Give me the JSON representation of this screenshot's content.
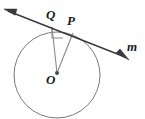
{
  "figure": {
    "kind": "geometry-diagram",
    "background_color": "#ffffff",
    "stroke_color": "#6b6b6b",
    "line_color": "#3a3a3a",
    "label_color": "#1a1a1a",
    "width": 145,
    "height": 119
  },
  "circle": {
    "label": "circle O",
    "center_x": 57,
    "center_y": 75,
    "radius": 43,
    "stroke": "#7a7a7a",
    "stroke_width": 1
  },
  "points": [
    {
      "id": "Q",
      "label": "Q",
      "x": 52,
      "y": 27,
      "label_x": 50,
      "label_y": 19,
      "on": "line m"
    },
    {
      "id": "P",
      "label": "P",
      "x": 73,
      "y": 33,
      "label_x": 71,
      "label_y": 25,
      "on": "circle and line m"
    },
    {
      "id": "O",
      "label": "O",
      "x": 57,
      "y": 73,
      "label_x": 50,
      "label_y": 84,
      "on": "center of circle"
    }
  ],
  "line": {
    "id": "m",
    "label": "m",
    "label_x": 131,
    "label_y": 49,
    "type": "double-headed-arrow",
    "x1": 6,
    "y1": 10,
    "x2": 127,
    "y2": 58,
    "stroke": "#3a3a3a",
    "stroke_width": 1.4
  },
  "segments": [
    {
      "id": "QO",
      "from": "Q",
      "to": "O",
      "x1": 52,
      "y1": 27,
      "x2": 57,
      "y2": 73
    },
    {
      "id": "PO",
      "from": "P",
      "to": "O",
      "x1": 73,
      "y1": 33,
      "x2": 57,
      "y2": 73
    }
  ],
  "right_angle_marker": {
    "label": "right-angle at Q",
    "vertex_x": 52,
    "vertex_y": 27,
    "size": 11
  },
  "center_dot": {
    "x": 57,
    "y": 73,
    "radius": 2
  }
}
